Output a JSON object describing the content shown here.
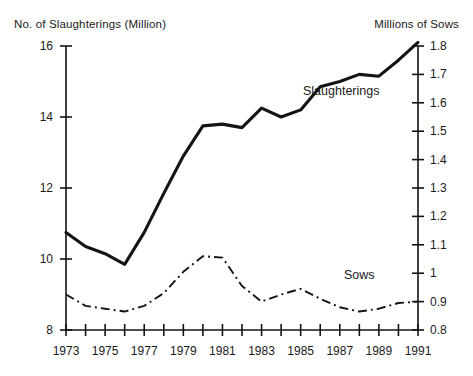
{
  "chart_data": {
    "type": "line",
    "title": "",
    "xlabel": "",
    "ylabel": "No. of Slaughterings (Million)",
    "y2label": "Millions of Sows",
    "grid": false,
    "legend_position": "inline-annotation",
    "x": [
      1973,
      1974,
      1975,
      1976,
      1977,
      1978,
      1979,
      1980,
      1981,
      1982,
      1983,
      1984,
      1985,
      1986,
      1987,
      1988,
      1989,
      1990,
      1991
    ],
    "xlim": [
      1973,
      1991
    ],
    "xticks": [
      1973,
      1974,
      1975,
      1976,
      1977,
      1978,
      1979,
      1980,
      1981,
      1982,
      1983,
      1984,
      1985,
      1986,
      1987,
      1988,
      1989,
      1990,
      1991
    ],
    "xticklabels": [
      "1973",
      "",
      "1975",
      "",
      "1977",
      "",
      "1979",
      "",
      "1981",
      "",
      "1983",
      "",
      "1985",
      "",
      "1987",
      "",
      "1989",
      "",
      "1991"
    ],
    "ylim": [
      8,
      16
    ],
    "yticks": [
      8,
      10,
      12,
      14,
      16
    ],
    "yticklabels": [
      "8",
      "10",
      "12",
      "14",
      "16"
    ],
    "y2lim": [
      0.8,
      1.8
    ],
    "y2ticks": [
      0.8,
      0.9,
      1.0,
      1.1,
      1.2,
      1.3,
      1.4,
      1.5,
      1.6,
      1.7,
      1.8
    ],
    "y2ticklabels": [
      "0.8",
      "0.9",
      "1",
      "1.1",
      "1.2",
      "1.3",
      "1.4",
      "1.5",
      "1.6",
      "1.7",
      "1.8"
    ],
    "series": [
      {
        "name": "Slaughterings",
        "axis": "left",
        "units": "Million",
        "style": "solid",
        "color": "#141414",
        "label_text": "Slaughterings",
        "values": [
          10.75,
          10.35,
          10.15,
          9.85,
          10.75,
          11.85,
          12.9,
          13.75,
          13.8,
          13.7,
          14.25,
          14.0,
          14.2,
          14.85,
          15.0,
          15.2,
          15.15,
          15.6,
          16.1
        ]
      },
      {
        "name": "Sows",
        "axis": "right",
        "units": "Millions",
        "style": "dash-dot",
        "color": "#141414",
        "label_text": "Sows",
        "values": [
          0.925,
          0.885,
          0.875,
          0.865,
          0.885,
          0.93,
          1.005,
          1.06,
          1.055,
          0.955,
          0.9,
          0.925,
          0.945,
          0.91,
          0.88,
          0.865,
          0.875,
          0.895,
          0.9
        ]
      }
    ]
  },
  "labels": {
    "left_axis_title": "No. of Slaughterings (Million)",
    "right_axis_title": "Millions of Sows"
  }
}
